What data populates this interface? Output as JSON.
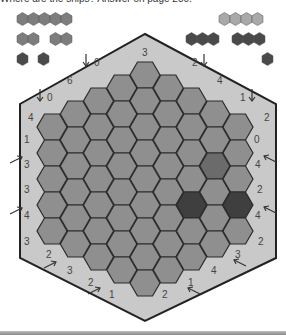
{
  "caption": "Where are the ships? Answer on page 250.",
  "colors": {
    "board_bg": "#c9c9c9",
    "board_border": "#222222",
    "cell": "#8f8f8f",
    "cell_border": "#2a2a2a",
    "shaded_medium": "#6b6b6b",
    "shaded_dark": "#3f3f3f",
    "fleet_large": "#7d7d7d",
    "fleet_light": "#a9a9a9",
    "fleet_dark": "#4a4a4a",
    "bottom_bar": "#9e9e9e"
  },
  "fleet": [
    {
      "name": "ship-5",
      "x": 17,
      "y": 13,
      "length": 5,
      "shade": "fleet_large"
    },
    {
      "name": "ship-2a",
      "x": 17,
      "y": 33,
      "length": 2,
      "shade": "fleet_large"
    },
    {
      "name": "ship-2b",
      "x": 50,
      "y": 33,
      "length": 2,
      "shade": "fleet_large"
    },
    {
      "name": "ship-1a",
      "x": 17,
      "y": 53,
      "length": 1,
      "shade": "fleet_dark"
    },
    {
      "name": "ship-1b",
      "x": 38,
      "y": 53,
      "length": 1,
      "shade": "fleet_dark"
    },
    {
      "name": "ship-4",
      "x": 219,
      "y": 13,
      "length": 4,
      "shade": "fleet_light"
    },
    {
      "name": "ship-3a",
      "x": 186,
      "y": 33,
      "length": 3,
      "shade": "fleet_dark"
    },
    {
      "name": "ship-3b",
      "x": 232,
      "y": 33,
      "length": 3,
      "shade": "fleet_dark"
    },
    {
      "name": "ship-1c",
      "x": 262,
      "y": 53,
      "length": 1,
      "shade": "fleet_dark"
    }
  ],
  "board": {
    "outline": "145,34 276,104 276,258 145,321 20,258 20,104",
    "columns": [
      5,
      6,
      7,
      8,
      9,
      8,
      7,
      6,
      5
    ],
    "shaded_cells": [
      {
        "col": 7,
        "row": 2,
        "shade": "shaded_medium"
      },
      {
        "col": 6,
        "row": 4,
        "shade": "shaded_dark"
      },
      {
        "col": 8,
        "row": 3,
        "shade": "shaded_dark"
      }
    ]
  },
  "clues": [
    {
      "text": "3",
      "x": 142,
      "y": 56,
      "arrow": null
    },
    {
      "text": "0",
      "x": 94,
      "y": 66,
      "arrow": "down",
      "ax": 86
    },
    {
      "text": "2",
      "x": 192,
      "y": 66,
      "arrow": "down",
      "ax": 204
    },
    {
      "text": "6",
      "x": 67,
      "y": 84,
      "arrow": null
    },
    {
      "text": "4",
      "x": 217,
      "y": 84,
      "arrow": null
    },
    {
      "text": "0",
      "x": 47,
      "y": 101,
      "arrow": "down",
      "ax": 40
    },
    {
      "text": "1",
      "x": 240,
      "y": 101,
      "arrow": "down",
      "ax": 252
    },
    {
      "text": "4",
      "x": 28,
      "y": 121,
      "arrow": null
    },
    {
      "text": "2",
      "x": 264,
      "y": 121,
      "arrow": null
    },
    {
      "text": "1",
      "x": 24,
      "y": 143,
      "arrow": null
    },
    {
      "text": "3",
      "x": 24,
      "y": 168,
      "arrow": "up-right",
      "ax": 22,
      "ay": 157
    },
    {
      "text": "3",
      "x": 24,
      "y": 193,
      "arrow": null
    },
    {
      "text": "4",
      "x": 24,
      "y": 219,
      "arrow": "up-right",
      "ax": 22,
      "ay": 208
    },
    {
      "text": "3",
      "x": 24,
      "y": 245,
      "arrow": null
    },
    {
      "text": "2",
      "x": 46,
      "y": 258,
      "arrow": null
    },
    {
      "text": "3",
      "x": 67,
      "y": 274,
      "arrow": "up-right",
      "ax": 56,
      "ay": 262
    },
    {
      "text": "2",
      "x": 88,
      "y": 286,
      "arrow": null
    },
    {
      "text": "1",
      "x": 109,
      "y": 298,
      "arrow": "up-right",
      "ax": 100,
      "ay": 288
    },
    {
      "text": "2",
      "x": 162,
      "y": 298,
      "arrow": null
    },
    {
      "text": "1",
      "x": 188,
      "y": 286,
      "arrow": "up-left",
      "ax": 188,
      "ay": 288
    },
    {
      "text": "4",
      "x": 211,
      "y": 274,
      "arrow": null
    },
    {
      "text": "3",
      "x": 235,
      "y": 258,
      "arrow": "up-left",
      "ax": 234,
      "ay": 260
    },
    {
      "text": "2",
      "x": 258,
      "y": 245,
      "arrow": null
    },
    {
      "text": "0",
      "x": 254,
      "y": 143,
      "arrow": null
    },
    {
      "text": "4",
      "x": 255,
      "y": 168,
      "arrow": "up-left",
      "ax": 264,
      "ay": 156
    },
    {
      "text": "2",
      "x": 257,
      "y": 193,
      "arrow": null
    },
    {
      "text": "4",
      "x": 255,
      "y": 219,
      "arrow": "up-left",
      "ax": 264,
      "ay": 207
    }
  ]
}
